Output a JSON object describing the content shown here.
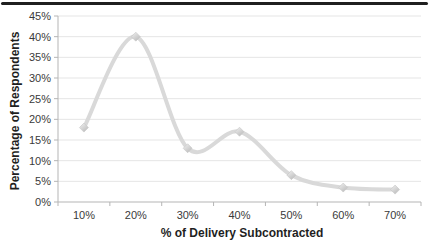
{
  "chart_data": {
    "type": "line",
    "smooth": true,
    "categories": [
      "10%",
      "20%",
      "30%",
      "40%",
      "50%",
      "60%",
      "70%"
    ],
    "values": [
      18,
      40,
      13,
      17,
      6.5,
      3.5,
      3
    ],
    "title": "",
    "xlabel": "% of Delivery Subcontracted",
    "ylabel": "Percentage of Respondents",
    "ylim": [
      0,
      45
    ],
    "y_tick_step": 5,
    "y_tick_labels": [
      "0%",
      "5%",
      "10%",
      "15%",
      "20%",
      "25%",
      "30%",
      "35%",
      "40%",
      "45%"
    ],
    "legend": "none",
    "grid": "horizontal",
    "marker": "diamond",
    "colors": {
      "line": "#d9d9d9",
      "marker_light": "#f2f2f2",
      "marker_dark": "#bdbdbd",
      "marker_edge": "#c6c6c6",
      "gridline": "#e5e5e5",
      "axis": "#b5b5b5",
      "tick_text": "#3a3a3a",
      "title_text": "#1f1f1f"
    }
  },
  "decor": {
    "top_rule_color": "#1f1f1f"
  }
}
